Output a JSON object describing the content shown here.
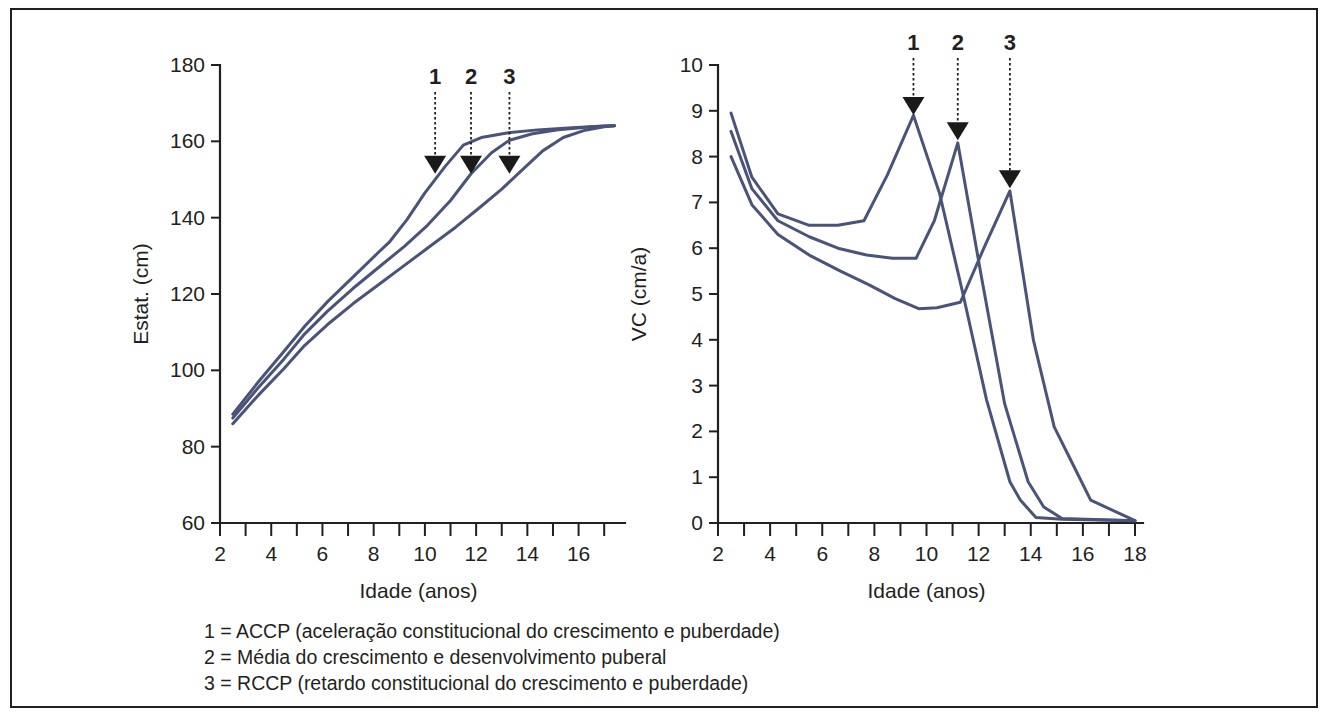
{
  "figure": {
    "border_color": "#231f20",
    "background": "#ffffff",
    "curve_color": "#4a5378",
    "annotation_color": "#1a1a1a"
  },
  "legend": {
    "lines": [
      "1 = ACCP (aceleração constitucional do crescimento e puberdade)",
      "2 = Média do crescimento e desenvolvimento puberal",
      "3 = RCCP (retardo constitucional do crescimento e puberdade)"
    ]
  },
  "chart_data": [
    {
      "type": "line",
      "id": "height-for-age",
      "title": "",
      "xlabel": "Idade (anos)",
      "ylabel": "Estat. (cm)",
      "xlim": [
        2,
        17.5
      ],
      "ylim": [
        60,
        180
      ],
      "xticks_major": [
        2,
        4,
        6,
        8,
        10,
        12,
        14,
        16
      ],
      "xticks_minor": [
        3,
        5,
        7,
        9,
        11,
        13,
        15,
        17
      ],
      "yticks": [
        60,
        80,
        100,
        120,
        140,
        160,
        180
      ],
      "grid": false,
      "legend_position": "below-figure",
      "annotations": [
        {
          "label": "1",
          "x": 10.4,
          "y": 152.0,
          "target_series": "ACCP"
        },
        {
          "label": "2",
          "x": 11.8,
          "y": 152.0,
          "target_series": "Media"
        },
        {
          "label": "3",
          "x": 13.3,
          "y": 152.0,
          "target_series": "RCCP"
        }
      ],
      "series": [
        {
          "name": "ACCP",
          "label": "1 = ACCP (aceleração constitucional do crescimento e puberdade)",
          "x": [
            2.5,
            3.5,
            4.5,
            5.3,
            6.2,
            7.2,
            8.2,
            8.6,
            9.3,
            10.0,
            10.8,
            11.5,
            12.2,
            13.2,
            14.4,
            15.6,
            16.6,
            17.4
          ],
          "y": [
            88.5,
            97.0,
            105.0,
            111.5,
            118.0,
            124.5,
            131.0,
            133.5,
            139.5,
            146.5,
            153.5,
            159.0,
            161.0,
            162.2,
            163.0,
            163.5,
            163.9,
            164.1
          ]
        },
        {
          "name": "Media",
          "label": "2 = Média do crescimento e desenvolvimento puberal",
          "x": [
            2.5,
            3.5,
            4.5,
            5.3,
            6.2,
            7.2,
            8.2,
            9.2,
            10.1,
            11.0,
            11.8,
            12.6,
            13.3,
            14.2,
            15.2,
            16.2,
            17.0,
            17.4
          ],
          "y": [
            87.5,
            95.5,
            103.0,
            109.5,
            115.5,
            121.5,
            127.0,
            132.5,
            138.0,
            144.5,
            151.5,
            157.0,
            160.3,
            162.0,
            163.0,
            163.6,
            164.0,
            164.1
          ]
        },
        {
          "name": "RCCP",
          "label": "3 = RCCP (retardo constitucional do crescimento e puberdade)",
          "x": [
            2.5,
            3.5,
            4.5,
            5.3,
            6.2,
            7.2,
            8.2,
            9.2,
            10.2,
            11.2,
            12.2,
            13.0,
            13.8,
            14.6,
            15.4,
            16.2,
            17.0,
            17.4
          ],
          "y": [
            86.0,
            93.5,
            100.5,
            106.5,
            112.0,
            117.5,
            122.5,
            127.5,
            132.5,
            137.5,
            143.0,
            147.5,
            152.5,
            157.5,
            161.0,
            162.8,
            163.8,
            164.1
          ]
        }
      ]
    },
    {
      "type": "line",
      "id": "height-velocity-for-age",
      "title": "",
      "xlabel": "Idade (anos)",
      "ylabel": "VC (cm/a)",
      "xlim": [
        2,
        18
      ],
      "ylim": [
        0,
        10
      ],
      "xticks_major": [
        2,
        4,
        6,
        8,
        10,
        12,
        14,
        16,
        18
      ],
      "xticks_minor": [
        3,
        5,
        7,
        9,
        11,
        13,
        15,
        17
      ],
      "yticks": [
        0,
        1,
        2,
        3,
        4,
        5,
        6,
        7,
        8,
        9,
        10
      ],
      "grid": false,
      "legend_position": "below-figure",
      "annotations": [
        {
          "label": "1",
          "x": 9.5,
          "y": 8.95,
          "target_series": "ACCP",
          "peak": 8.9
        },
        {
          "label": "2",
          "x": 11.2,
          "y": 8.4,
          "target_series": "Media",
          "peak": 8.3
        },
        {
          "label": "3",
          "x": 13.2,
          "y": 7.35,
          "target_series": "RCCP",
          "peak": 7.25
        }
      ],
      "series": [
        {
          "name": "ACCP",
          "label": "1 = ACCP (aceleração constitucional do crescimento e puberdade)",
          "x": [
            2.5,
            3.3,
            4.3,
            5.5,
            6.6,
            7.6,
            8.5,
            9.5,
            10.5,
            11.4,
            12.3,
            13.2,
            13.6,
            14.2,
            15.2,
            18.0
          ],
          "y": [
            8.95,
            7.55,
            6.75,
            6.5,
            6.5,
            6.6,
            7.6,
            8.9,
            7.2,
            5.0,
            2.7,
            0.9,
            0.5,
            0.12,
            0.08,
            0.05
          ]
        },
        {
          "name": "Media",
          "label": "2 = Média do crescimento e desenvolvimento puberal",
          "x": [
            2.5,
            3.3,
            4.3,
            5.5,
            6.6,
            7.7,
            8.7,
            9.6,
            10.3,
            11.2,
            12.1,
            13.0,
            13.9,
            14.5,
            15.2,
            18.0
          ],
          "y": [
            8.55,
            7.3,
            6.6,
            6.25,
            6.0,
            5.85,
            5.78,
            5.78,
            6.6,
            8.3,
            5.4,
            2.6,
            0.9,
            0.35,
            0.1,
            0.05
          ]
        },
        {
          "name": "RCCP",
          "label": "3 = RCCP (retardo constitucional do crescimento e puberdade)",
          "x": [
            2.5,
            3.3,
            4.3,
            5.5,
            6.7,
            7.8,
            8.8,
            9.7,
            10.4,
            11.3,
            12.2,
            13.2,
            14.1,
            14.9,
            15.6,
            16.3,
            18.0
          ],
          "y": [
            8.0,
            6.95,
            6.3,
            5.85,
            5.5,
            5.2,
            4.9,
            4.68,
            4.7,
            4.82,
            6.0,
            7.25,
            4.0,
            2.1,
            1.3,
            0.5,
            0.05
          ]
        }
      ]
    }
  ]
}
